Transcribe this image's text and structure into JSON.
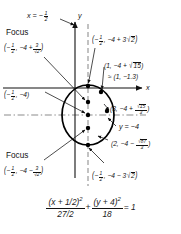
{
  "figure": {
    "type": "ellipse-graph",
    "axes": {
      "x_axis_label": "x",
      "y_axis_label": "y",
      "x_axis_y_pixel": 88,
      "y_axis_x_pixel": 75
    },
    "guides": [
      {
        "name": "vertical-axis-of-symmetry",
        "label": "x = −",
        "label_fraction": {
          "num": "1",
          "den": "2"
        },
        "style": "dashed"
      },
      {
        "name": "horizontal-axis-of-symmetry",
        "label": "y = −4",
        "style": "dash-dot"
      }
    ],
    "labels": {
      "x_equals_line": {
        "lhs": "x",
        "eq": "=",
        "sign": "−",
        "num": "1",
        "den": "2"
      },
      "focus_top_word": "Focus",
      "focus_top_point": {
        "open": "(",
        "x_sign": "−",
        "x_num": "1",
        "x_den": "2",
        "sep": ",",
        "y_base": "−4 +",
        "y_num": "3",
        "y_den": "√2",
        "close": ")"
      },
      "vertex_top": {
        "open": "(",
        "x_sign": "−",
        "x_num": "1",
        "x_den": "2",
        "sep": ",",
        "y": "−4 + 3",
        "radicand": "2",
        "close": ")"
      },
      "point_right_upper": {
        "text": "(1, −4 + ",
        "radicand": "15",
        "close": ")"
      },
      "point_right_upper_approx": {
        "text": "≈ (1, −1.3)"
      },
      "center": {
        "open": "(",
        "x_sign": "−",
        "x_num": "1",
        "x_den": "2",
        "sep": ",",
        "y": "−4",
        "close": ")"
      },
      "point_right_mid": {
        "text": "(3, −4 + ",
        "radicand": "15",
        "den": "3",
        "close": ")"
      },
      "y_equals_line": {
        "text": "y = −4"
      },
      "point_right_lower": {
        "text": "(2, −4 − ",
        "radicand": "87",
        "den": "3",
        "close": ")"
      },
      "focus_bottom_word": "Focus",
      "focus_bottom_point": {
        "open": "(",
        "x_sign": "−",
        "x_num": "1",
        "x_den": "2",
        "sep": ",",
        "y_base": "−4 −",
        "y_num": "3",
        "y_den": "√2",
        "close": ")"
      },
      "vertex_bottom": {
        "open": "(",
        "x_sign": "−",
        "x_num": "1",
        "x_den": "2",
        "sep": ",",
        "y": "−4 − 3",
        "radicand": "2",
        "close": ")"
      }
    },
    "equation": {
      "term1_num": "(x + 1/2)",
      "term1_num_exp": "2",
      "term1_den": "27/2",
      "plus": "+",
      "term2_num": "(y + 4)",
      "term2_num_exp": "2",
      "term2_den": "18",
      "equals": "= 1"
    },
    "colors": {
      "ink": "#111111",
      "curve": "#000000",
      "guide": "#8c8c8c",
      "background": "#ffffff"
    },
    "points": [
      {
        "name": "vertex-top",
        "cx": 88,
        "cy": 86
      },
      {
        "name": "focus-upper",
        "cx": 88,
        "cy": 102
      },
      {
        "name": "center",
        "cx": 88,
        "cy": 115
      },
      {
        "name": "focus-lower",
        "cx": 88,
        "cy": 128
      },
      {
        "name": "vertex-bottom",
        "cx": 88,
        "cy": 145
      },
      {
        "name": "point-1",
        "cx": 101,
        "cy": 92
      },
      {
        "name": "point-3",
        "cx": 107,
        "cy": 111
      }
    ]
  }
}
